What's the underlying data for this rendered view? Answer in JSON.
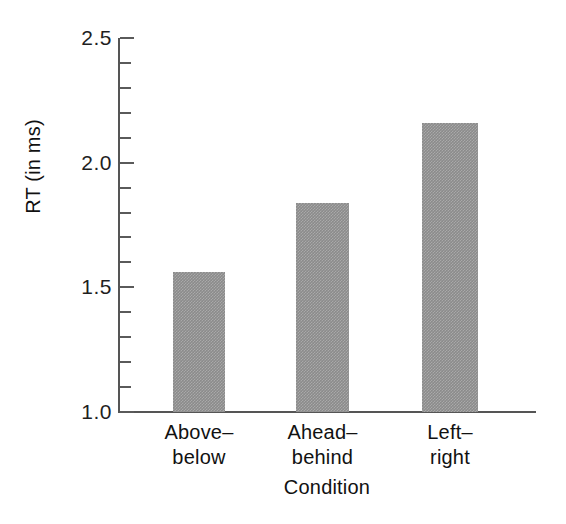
{
  "chart_data": {
    "type": "bar",
    "title": "",
    "xlabel": "Condition",
    "ylabel": "RT (in ms)",
    "categories": [
      "Above–below",
      "Ahead–behind",
      "Left–right"
    ],
    "category_lines": [
      [
        "Above–",
        "below"
      ],
      [
        "Ahead–",
        "behind"
      ],
      [
        "Left–",
        "right"
      ]
    ],
    "values": [
      1.56,
      1.84,
      2.16
    ],
    "ylim": [
      1.0,
      2.5
    ],
    "ytick_major": [
      "1.0",
      "1.5",
      "2.0",
      "2.5"
    ],
    "ytick_major_values": [
      1.0,
      1.5,
      2.0,
      2.5
    ],
    "ytick_minor_values": [
      1.1,
      1.2,
      1.3,
      1.4,
      1.6,
      1.7,
      1.8,
      1.9,
      2.1,
      2.2,
      2.3,
      2.4
    ],
    "grid": false,
    "legend": false,
    "bar_color": "#8b8b8b",
    "axis_color": "#555555",
    "text_color": "#111111"
  }
}
